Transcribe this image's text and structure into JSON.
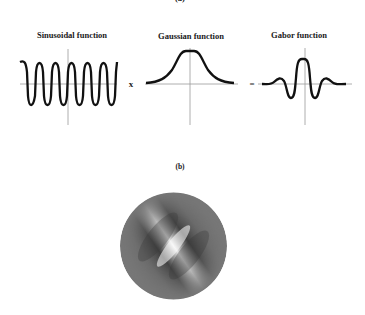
{
  "panel_a": {
    "label": "(a)",
    "plots": [
      {
        "title": "Sinusoidal function",
        "curve": "cosine, 4 full periods"
      },
      {
        "title": "Gaussian function",
        "curve": "bell curve"
      },
      {
        "title": "Gabor function",
        "curve": "cosine modulated by Gaussian"
      }
    ],
    "operators": [
      "x",
      "="
    ]
  },
  "panel_b": {
    "label": "(b)",
    "image": "2D Gabor patch, grayscale, oriented diagonally (~45°) in circular aperture"
  },
  "colors": {
    "curve": "#111111",
    "axis": "#999999",
    "background": "#ffffff",
    "patch_mid": "#808080"
  }
}
